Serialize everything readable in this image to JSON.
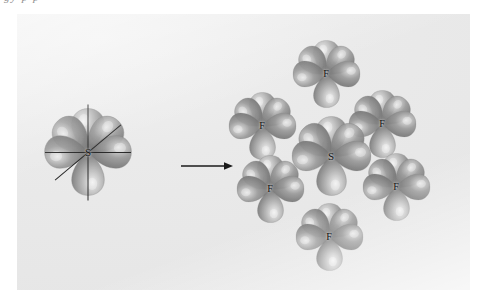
{
  "figure": {
    "caption_fragment": "gy    p      p",
    "background_color": "#e8e8e8",
    "page_background": "#ffffff",
    "lobe_color": "#9a9a9a",
    "lobe_highlight_color": "#e3e3e3",
    "lobe_shadow_color": "#6f6f6f",
    "axis_color": "#2a2a2a",
    "arrow_color": "#1a1a1a"
  },
  "left_structure": {
    "name": "sp3d2-hybrid-orbitals-on-sulfur",
    "center_label": "S",
    "lobe_count": 6,
    "axis_count": 3,
    "center": {
      "x": 88,
      "y": 152
    }
  },
  "arrow": {
    "label": "forms",
    "direction": "right"
  },
  "right_structure": {
    "name": "sulfur-hexafluoride-orbital-overlap",
    "center_label": "S",
    "center": {
      "x": 331,
      "y": 156
    },
    "ligands": [
      {
        "label": "F",
        "position": "top",
        "x": 326,
        "y": 74
      },
      {
        "label": "F",
        "position": "upper-left",
        "x": 262,
        "y": 126
      },
      {
        "label": "F",
        "position": "upper-right",
        "x": 382,
        "y": 124
      },
      {
        "label": "F",
        "position": "lower-left",
        "x": 270,
        "y": 189
      },
      {
        "label": "F",
        "position": "lower-right",
        "x": 396,
        "y": 187
      },
      {
        "label": "F",
        "position": "bottom",
        "x": 329,
        "y": 237
      }
    ]
  },
  "chart_data": {
    "type": "diagram",
    "panels": [
      {
        "name": "hybrid-orbital-set",
        "atom": "S",
        "lobes": 6,
        "geometry": "octahedral",
        "hybridization": "sp3d2"
      },
      {
        "name": "sf6-molecule",
        "central_atom": "S",
        "ligand_atom": "F",
        "ligand_count": 6,
        "geometry": "octahedral",
        "formula": "SF6"
      }
    ],
    "connector": "arrow-right"
  }
}
